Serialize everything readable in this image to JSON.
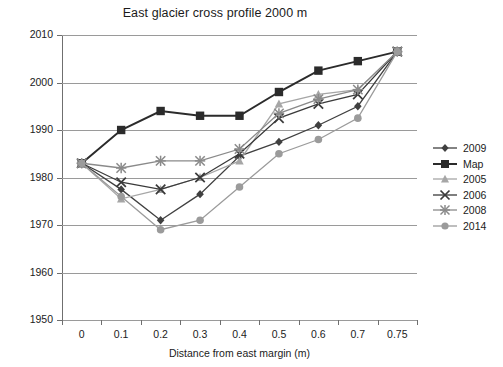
{
  "chart_data": {
    "type": "line",
    "title": "East glacier cross profile 2000 m",
    "xlabel": "Distance from east margin (m)",
    "ylabel": "Surface elevation (m)",
    "categories": [
      "0",
      "0.1",
      "0.2",
      "0.3",
      "0.4",
      "0.5",
      "0.6",
      "0.7",
      "0.75"
    ],
    "ylim": [
      1950,
      2010
    ],
    "yticks": [
      1950,
      1960,
      1970,
      1980,
      1990,
      2000,
      2010
    ],
    "ytick_labels": [
      "1950",
      "1960",
      "1970",
      "1980",
      "1990",
      "2000",
      "2010"
    ],
    "grid": "horizontal",
    "legend_position": "right",
    "series": [
      {
        "name": "2009",
        "marker": "diamond",
        "color": "#404040",
        "values": [
          1983,
          1977.5,
          1971,
          1976.5,
          1984.5,
          1987.5,
          1991,
          1995,
          2006.5
        ]
      },
      {
        "name": "Map",
        "marker": "square",
        "color": "#2b2b2b",
        "values": [
          1983,
          1990,
          1994,
          1993,
          1993,
          1998,
          2002.5,
          2004.5,
          2006.5
        ]
      },
      {
        "name": "2005",
        "marker": "triangle",
        "color": "#a6a6a6",
        "values": [
          1983,
          1975.5,
          1977.5,
          1980,
          1983.5,
          1995.5,
          1997.5,
          1998.5,
          2006.5
        ]
      },
      {
        "name": "2006",
        "marker": "cross",
        "color": "#3a3a3a",
        "values": [
          1983,
          1979,
          1977.5,
          1980,
          1985,
          1992.5,
          1995.5,
          1997.5,
          2006.5
        ]
      },
      {
        "name": "2008",
        "marker": "asterisk",
        "color": "#8a8a8a",
        "values": [
          1983,
          1982,
          1983.5,
          1983.5,
          1986,
          1993.5,
          1996.5,
          1998.5,
          2006.5
        ]
      },
      {
        "name": "2014",
        "marker": "circle",
        "color": "#9b9b9b",
        "values": [
          1983,
          1976,
          1969,
          1971,
          1978,
          1985,
          1988,
          1992.5,
          2006.5
        ]
      }
    ]
  }
}
